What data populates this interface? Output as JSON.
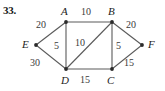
{
  "problem": {
    "number": "33."
  },
  "chart_data": {
    "type": "diagram",
    "title": "",
    "subtitle": "",
    "xlabel": "",
    "ylabel": "",
    "grid": false,
    "legend": null,
    "nodes": [
      {
        "id": "A",
        "label": "A",
        "x": 66,
        "y": 22,
        "label_x": 61,
        "label_y": 6
      },
      {
        "id": "B",
        "label": "B",
        "x": 112,
        "y": 22,
        "label_x": 108,
        "label_y": 6
      },
      {
        "id": "E",
        "label": "E",
        "x": 36,
        "y": 45,
        "label_x": 22,
        "label_y": 39
      },
      {
        "id": "F",
        "label": "F",
        "x": 142,
        "y": 45,
        "label_x": 148,
        "label_y": 39
      },
      {
        "id": "D",
        "label": "D",
        "x": 66,
        "y": 69,
        "label_x": 61,
        "label_y": 75
      },
      {
        "id": "C",
        "label": "C",
        "x": 112,
        "y": 69,
        "label_x": 107,
        "label_y": 75
      }
    ],
    "edges": [
      {
        "from": "A",
        "to": "B",
        "weight": "10",
        "label_x": 81,
        "label_y": 7
      },
      {
        "from": "E",
        "to": "A",
        "weight": "20",
        "label_x": 36,
        "label_y": 20
      },
      {
        "from": "B",
        "to": "F",
        "weight": "20",
        "label_x": 126,
        "label_y": 20
      },
      {
        "from": "A",
        "to": "D",
        "weight": "5",
        "label_x": 54,
        "label_y": 41
      },
      {
        "from": "D",
        "to": "B",
        "weight": "10",
        "label_x": 75,
        "label_y": 38
      },
      {
        "from": "B",
        "to": "C",
        "weight": "5",
        "label_x": 116,
        "label_y": 41
      },
      {
        "from": "E",
        "to": "D",
        "weight": "30",
        "label_x": 30,
        "label_y": 58
      },
      {
        "from": "D",
        "to": "C",
        "weight": "15",
        "label_x": 80,
        "label_y": 75
      },
      {
        "from": "C",
        "to": "F",
        "weight": "15",
        "label_x": 124,
        "label_y": 58
      }
    ]
  },
  "colors": {
    "edge": "#5a5a5a",
    "node": "#2b2b2b",
    "text": "#232323",
    "weight_text": "#3a3a3a",
    "background": "#ffffff"
  }
}
